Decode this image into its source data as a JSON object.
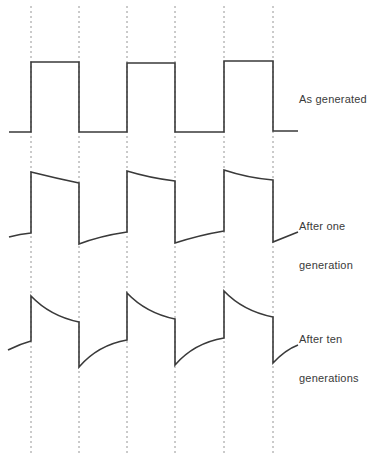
{
  "diagram": {
    "title": "",
    "colors": {
      "background": "#ffffff",
      "trace": "#3a3a3a",
      "gridline": "#8a8a8a",
      "text": "#3a3a3a"
    },
    "gridlines": {
      "style": "dashed",
      "x": [
        31,
        79,
        127,
        175,
        224,
        273
      ],
      "y_top": 6,
      "y_bottom": 456
    },
    "waveforms": [
      {
        "id": "as-generated",
        "label_lines": [
          "As generated"
        ],
        "label_x": 299,
        "label_y": 67,
        "description": "Ideal square wave",
        "path": "M9,132 L31,132 L31,62 L79,62 L79,132 L127,132 L127,63 L175,63 L175,132 L224,132 L224,61 L273,61 L273,131 L298,131"
      },
      {
        "id": "after-one-generation",
        "label_lines": [
          "After one",
          "generation"
        ],
        "label_x": 299,
        "label_y": 194,
        "description": "Square wave with slight droop/tilt",
        "path": "M9,237 Q20,234 31,233 L31,172 Q55,178 79,183 L79,244 Q100,236 127,232 L127,171 Q150,178 175,181 L175,243 Q200,235 224,231 L224,170 Q248,178 273,180 L273,242 L298,232"
      },
      {
        "id": "after-ten-generations",
        "label_lines": [
          "After ten",
          "generations"
        ],
        "label_x": 299,
        "label_y": 307,
        "description": "Square wave with pronounced exponential droop",
        "path": "M8,350 Q20,344 31,341 L31,296 Q50,316 79,322 L79,367 Q98,345 127,340 L127,293 Q146,313 175,319 L175,365 Q194,343 224,338 L224,291 Q243,311 273,317 L273,363 Q285,350 298,345"
      }
    ]
  }
}
